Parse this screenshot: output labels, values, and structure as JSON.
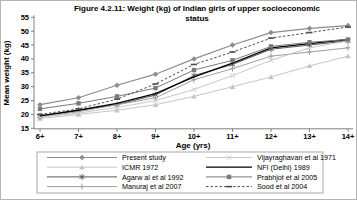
{
  "figure": {
    "title_line1": "Figure 4.2.11: Weight (kg) of Indian girls of upper socioeconomic",
    "title_line2": "status"
  },
  "chart_data": {
    "type": "line",
    "title": "Figure 4.2.11: Weight (kg) of Indian girls of upper socioeconomic status",
    "xlabel": "Age (yrs)",
    "ylabel": "Mean weight (kg)",
    "ylim": [
      15,
      55
    ],
    "y_ticks": [
      15,
      20,
      25,
      30,
      35,
      40,
      45,
      50,
      55
    ],
    "categories": [
      "6+",
      "7+",
      "8+",
      "9+",
      "10+",
      "11+",
      "12+",
      "13+",
      "14+"
    ],
    "grid": false,
    "legend_position": "bottom",
    "series": [
      {
        "name": "Present study",
        "marker": "diamond",
        "color": "#8c8c8c",
        "dash": "solid",
        "width": 1.2,
        "values": [
          23.5,
          26,
          30.5,
          34.5,
          40,
          45,
          49.5,
          51,
          52
        ]
      },
      {
        "name": "ICMR 1972",
        "marker": "triangle",
        "color": "#c6c6c6",
        "dash": "solid",
        "width": 1,
        "values": [
          18.5,
          20,
          21.5,
          23.5,
          26.5,
          30,
          33.5,
          37.5,
          41
        ]
      },
      {
        "name": "Agarw al et al 1992",
        "marker": "asterisk",
        "color": "#5a5a5a",
        "dash": "solid",
        "width": 1,
        "values": [
          19.5,
          21.5,
          23.5,
          27,
          34,
          38,
          43.5,
          45,
          46.5
        ]
      },
      {
        "name": "Manuraj et al 2007",
        "marker": "plus",
        "color": "#9e9e9e",
        "dash": "solid",
        "width": 1,
        "values": [
          19,
          21,
          23.5,
          26,
          32.5,
          36.5,
          41,
          42.5,
          44
        ]
      },
      {
        "name": "Vijayraghavan et al 1971",
        "marker": "x",
        "color": "#c9c9c9",
        "dash": "solid",
        "width": 1,
        "values": [
          19,
          20.5,
          22.5,
          25,
          29,
          34,
          39.5,
          44,
          46.5
        ]
      },
      {
        "name": "NFI (Delhi) 1989",
        "marker": "none",
        "color": "#000000",
        "dash": "solid",
        "width": 1.3,
        "values": [
          19.5,
          21.5,
          24,
          27.5,
          33.5,
          38.5,
          44,
          45.5,
          47
        ]
      },
      {
        "name": "Prabhjot et al 2005",
        "marker": "square",
        "color": "#7a7a7a",
        "dash": "solid",
        "width": 1,
        "values": [
          22,
          24,
          26.5,
          29.5,
          36,
          39.5,
          44.5,
          46,
          47
        ]
      },
      {
        "name": "Sood et al 2004",
        "marker": "dash",
        "color": "#4d4d4d",
        "dash": "dotted",
        "width": 1,
        "values": [
          20,
          22,
          25.5,
          31,
          38,
          42.5,
          47.5,
          49.5,
          51.5
        ]
      }
    ],
    "legend_columns": [
      [
        "Present study",
        "ICMR 1972",
        "Agarw al et al 1992",
        "Manuraj et al 2007"
      ],
      [
        "Vijayraghavan et al 1971",
        "NFI (Delhi) 1989",
        "Prabhjot et al 2005",
        "Sood et al 2004"
      ]
    ]
  }
}
